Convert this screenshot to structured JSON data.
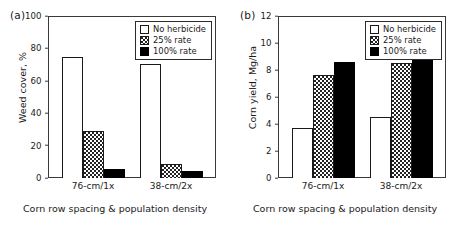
{
  "figure": {
    "background": "#ffffff",
    "panels": [
      {
        "label": "(a)",
        "ylabel": "Weed cover, %",
        "xlabel": "Corn row spacing & population density"
      },
      {
        "label": "(b)",
        "ylabel": "Corn yield, Mg/ha",
        "xlabel": "Corn row spacing & population density"
      }
    ]
  },
  "legend": {
    "entries": [
      {
        "label": "No herbicide",
        "fill": "none",
        "color": "#ffffff"
      },
      {
        "label": "25% rate",
        "fill": "stipple",
        "color": "#222222"
      },
      {
        "label": "100% rate",
        "fill": "solid",
        "color": "#000000"
      }
    ]
  },
  "chart_data": [
    {
      "type": "bar",
      "panel": "(a)",
      "title": "",
      "xlabel": "Corn row spacing & population density",
      "ylabel": "Weed cover, %",
      "categories": [
        "76-cm/1x",
        "38-cm/2x"
      ],
      "ylim": [
        0,
        100
      ],
      "yticks": [
        0,
        20,
        40,
        60,
        80,
        100
      ],
      "grid": false,
      "legend_position": "upper-right",
      "series": [
        {
          "name": "No herbicide",
          "values": [
            75.0,
            70.5
          ]
        },
        {
          "name": "25% rate",
          "values": [
            29.0,
            8.5
          ]
        },
        {
          "name": "100% rate",
          "values": [
            5.5,
            4.5
          ]
        }
      ]
    },
    {
      "type": "bar",
      "panel": "(b)",
      "title": "",
      "xlabel": "Corn row spacing & population density",
      "ylabel": "Corn yield, Mg/ha",
      "categories": [
        "76-cm/1x",
        "38-cm/2x"
      ],
      "ylim": [
        0,
        12
      ],
      "yticks": [
        0,
        2,
        4,
        6,
        8,
        10,
        12
      ],
      "grid": false,
      "legend_position": "upper-right",
      "series": [
        {
          "name": "No herbicide",
          "values": [
            3.7,
            4.55
          ]
        },
        {
          "name": "25% rate",
          "values": [
            7.65,
            8.5
          ]
        },
        {
          "name": "100% rate",
          "values": [
            8.6,
            8.85
          ]
        }
      ]
    }
  ]
}
